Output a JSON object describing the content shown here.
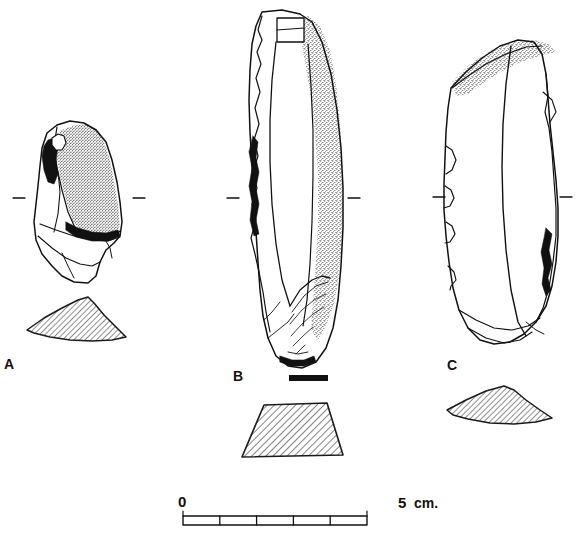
{
  "plate": {
    "kind": "archaeological-line-drawing",
    "description": "Plate of three lithic artifacts (stone tools) in plan view with hatched cross-section profiles below each, and a metric scale bar.",
    "background_color": "#ffffff",
    "ink_color": "#111111",
    "cortex_stipple_color": "#1a1a1a",
    "hatch_color": "#1f1f1f"
  },
  "figures": [
    {
      "id": "A",
      "label": "A",
      "artifact_type": "retouched flake / side scraper",
      "has_cortex_stipple": true,
      "has_black_crushing": true,
      "profile_shape": "asymmetric low triangle",
      "axis_ticks": 2
    },
    {
      "id": "B",
      "label": "B",
      "artifact_type": "elongated blade with cortical edge",
      "has_cortex_stipple": true,
      "has_black_crushing": true,
      "profile_shape": "trapezoid",
      "axis_ticks": 2,
      "has_solid_bar_marker": true
    },
    {
      "id": "C",
      "label": "C",
      "artifact_type": "blade with notched edge",
      "has_cortex_stipple": true,
      "has_black_crushing": true,
      "profile_shape": "asymmetric low triangle",
      "axis_ticks": 2
    }
  ],
  "scale_bar": {
    "start_label": "0",
    "end_label": "5",
    "unit_label": "cm.",
    "divisions": 5,
    "division_value": 1,
    "total_value": 5,
    "orientation": "horizontal"
  }
}
